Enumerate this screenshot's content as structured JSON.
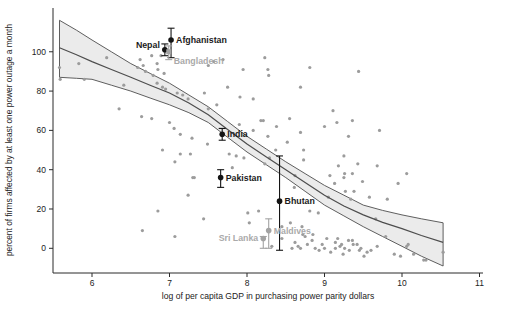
{
  "chart_data": {
    "type": "scatter",
    "title": "",
    "xlabel": "log of per capita GDP in purchasing power parity dollars",
    "ylabel": "percent of firms affected by at least one power outage a month",
    "xlim": [
      5.5,
      11.05
    ],
    "ylim": [
      -12.5,
      122
    ],
    "x_ticks": [
      6,
      7,
      8,
      9,
      10,
      11
    ],
    "y_ticks": [
      0,
      20,
      40,
      60,
      80,
      100
    ],
    "grid": "off",
    "legend": "none",
    "colors": {
      "scatter": "#9c9c9c",
      "band_fill": "#ebebeb",
      "band_edge": "#4d4d4d",
      "regression_line": "#4d4d4d",
      "labeled_dark": "#141414",
      "labeled_gray": "#a3a3a3",
      "axis": "#2b2b2b",
      "tick_text": "#222222"
    },
    "regression": {
      "x": [
        5.58,
        5.8,
        6.0,
        6.25,
        6.5,
        6.75,
        7.0,
        7.25,
        7.5,
        7.75,
        8.0,
        8.25,
        8.5,
        8.75,
        9.0,
        9.25,
        9.5,
        9.75,
        10.0,
        10.25,
        10.53
      ],
      "center": [
        102,
        98.5,
        95,
        91,
        87,
        83,
        79,
        74,
        68,
        60.5,
        53,
        46.5,
        40,
        33.5,
        27,
        21.5,
        17,
        13.2,
        10,
        6.5,
        3
      ],
      "upper": [
        116,
        111,
        106,
        100,
        94,
        89,
        84,
        78,
        72,
        64.5,
        57,
        50.5,
        44,
        38,
        32,
        27,
        22,
        19.3,
        17,
        15,
        13
      ],
      "lower": [
        87,
        86.5,
        86,
        83,
        80,
        76.5,
        73,
        69,
        64,
        56.5,
        49,
        42.5,
        36,
        29,
        22,
        16.5,
        11,
        6,
        1,
        -4,
        -9
      ]
    },
    "labeled_points": [
      {
        "name": "Nepal",
        "x": 6.94,
        "y": 101,
        "ci_low": 98,
        "ci_high": 104,
        "shade": "dark",
        "marker": "circle",
        "side": "left",
        "dy": -2
      },
      {
        "name": "Afghanistan",
        "x": 7.02,
        "y": 106,
        "ci_low": 97,
        "ci_high": 112,
        "shade": "dark",
        "marker": "circle",
        "side": "right",
        "dy": 3
      },
      {
        "name": "Bangladesh",
        "x": 6.99,
        "y": 100,
        "ci_low": 96,
        "ci_high": 103,
        "shade": "gray",
        "marker": "square",
        "side": "right",
        "dy": 12
      },
      {
        "name": "India",
        "x": 7.68,
        "y": 58,
        "ci_low": 55,
        "ci_high": 61,
        "shade": "dark",
        "marker": "circle",
        "side": "right",
        "dy": 3
      },
      {
        "name": "Pakistan",
        "x": 7.66,
        "y": 36,
        "ci_low": 31,
        "ci_high": 40,
        "shade": "dark",
        "marker": "circle",
        "side": "right",
        "dy": 3
      },
      {
        "name": "Bhutan",
        "x": 8.42,
        "y": 24,
        "ci_low": -1,
        "ci_high": 47,
        "shade": "dark",
        "marker": "circle",
        "side": "right",
        "dy": 3
      },
      {
        "name": "Maldives",
        "x": 8.28,
        "y": 9,
        "ci_low": 0,
        "ci_high": 15,
        "shade": "gray",
        "marker": "circle",
        "side": "right",
        "dy": 3
      },
      {
        "name": "Sri Lanka",
        "x": 8.21,
        "y": 5,
        "ci_low": 0,
        "ci_high": 6,
        "shade": "gray",
        "marker": "circle",
        "side": "left",
        "dy": 3
      }
    ],
    "scatter": [
      [
        5.58,
        92
      ],
      [
        5.59,
        86
      ],
      [
        5.83,
        94
      ],
      [
        5.9,
        86
      ],
      [
        6.19,
        97
      ],
      [
        6.41,
        83
      ],
      [
        6.59,
        92
      ],
      [
        6.62,
        96
      ],
      [
        6.66,
        93
      ],
      [
        6.77,
        98
      ],
      [
        6.69,
        90
      ],
      [
        6.84,
        94
      ],
      [
        6.89,
        98
      ],
      [
        6.85,
        91
      ],
      [
        6.93,
        89
      ],
      [
        6.79,
        88
      ],
      [
        6.84,
        84
      ],
      [
        6.91,
        82
      ],
      [
        6.95,
        81
      ],
      [
        7.1,
        79
      ],
      [
        7.17,
        78
      ],
      [
        7.24,
        76
      ],
      [
        6.35,
        71
      ],
      [
        6.64,
        67
      ],
      [
        6.77,
        66
      ],
      [
        7.0,
        64
      ],
      [
        7.06,
        61
      ],
      [
        7.14,
        58
      ],
      [
        7.29,
        56
      ],
      [
        7.57,
        95
      ],
      [
        7.69,
        96
      ],
      [
        7.5,
        93
      ],
      [
        7.95,
        91
      ],
      [
        8.23,
        97
      ],
      [
        8.27,
        91
      ],
      [
        8.28,
        88
      ],
      [
        8.81,
        92
      ],
      [
        8.69,
        82
      ],
      [
        7.75,
        82
      ],
      [
        7.91,
        77
      ],
      [
        8.08,
        76
      ],
      [
        7.45,
        79
      ],
      [
        7.61,
        73
      ],
      [
        7.5,
        71
      ],
      [
        9.11,
        70
      ],
      [
        8.55,
        66
      ],
      [
        8.21,
        65
      ],
      [
        8.38,
        62
      ],
      [
        8.08,
        60
      ],
      [
        8.27,
        57
      ],
      [
        9.0,
        62
      ],
      [
        9.44,
        90
      ],
      [
        9.16,
        64
      ],
      [
        9.36,
        65
      ],
      [
        9.31,
        57
      ],
      [
        9.71,
        60
      ],
      [
        7.9,
        63
      ],
      [
        8.18,
        65
      ],
      [
        8.37,
        50
      ],
      [
        8.52,
        54
      ],
      [
        8.69,
        59
      ],
      [
        8.73,
        50
      ],
      [
        7.77,
        48
      ],
      [
        7.86,
        47
      ],
      [
        7.96,
        46
      ],
      [
        8.29,
        46
      ],
      [
        7.49,
        53
      ],
      [
        8.73,
        45
      ],
      [
        8.61,
        31
      ],
      [
        7.3,
        36
      ],
      [
        7.24,
        27
      ],
      [
        6.91,
        50
      ],
      [
        7.14,
        48
      ],
      [
        7.27,
        48
      ],
      [
        7.07,
        44
      ],
      [
        7.32,
        36
      ],
      [
        6.85,
        19
      ],
      [
        6.65,
        9
      ],
      [
        7.07,
        6
      ],
      [
        7.44,
        15
      ],
      [
        7.81,
        41
      ],
      [
        8.23,
        43
      ],
      [
        8.62,
        37
      ],
      [
        9.07,
        37
      ],
      [
        9.26,
        38
      ],
      [
        9.27,
        29
      ],
      [
        9.05,
        26
      ],
      [
        9.34,
        25
      ],
      [
        8.81,
        19
      ],
      [
        8.92,
        18
      ],
      [
        8.01,
        18
      ],
      [
        8.15,
        19
      ],
      [
        8.03,
        13
      ],
      [
        8.56,
        13
      ],
      [
        8.71,
        11
      ],
      [
        8.45,
        11
      ],
      [
        8.75,
        6
      ],
      [
        8.84,
        4
      ],
      [
        8.97,
        2
      ],
      [
        9.03,
        5
      ],
      [
        9.14,
        3
      ],
      [
        9.22,
        2
      ],
      [
        9.31,
        4
      ],
      [
        9.37,
        2
      ],
      [
        8.45,
        5
      ],
      [
        8.32,
        1
      ],
      [
        8.58,
        0
      ],
      [
        8.69,
        0
      ],
      [
        9.24,
        -3
      ],
      [
        8.62,
        3
      ],
      [
        8.66,
        1
      ],
      [
        8.78,
        2
      ],
      [
        8.88,
        0
      ],
      [
        8.93,
        -1
      ],
      [
        9.0,
        0
      ],
      [
        9.08,
        -2
      ],
      [
        9.42,
        2
      ],
      [
        9.47,
        0
      ],
      [
        9.55,
        -2
      ],
      [
        8.72,
        7
      ],
      [
        8.85,
        7
      ],
      [
        9.17,
        5
      ],
      [
        9.25,
        47
      ],
      [
        9.18,
        42
      ],
      [
        9.43,
        43
      ],
      [
        9.68,
        42
      ],
      [
        9.25,
        36
      ],
      [
        9.36,
        38
      ],
      [
        9.49,
        34
      ],
      [
        10.06,
        38
      ],
      [
        9.95,
        33
      ],
      [
        9.13,
        33
      ],
      [
        9.38,
        29
      ],
      [
        9.58,
        26
      ],
      [
        9.81,
        25
      ],
      [
        9.66,
        15
      ],
      [
        9.79,
        6
      ],
      [
        10.06,
        1
      ],
      [
        10.15,
        -3
      ],
      [
        10.28,
        -6
      ],
      [
        9.14,
        0
      ],
      [
        9.2,
        1
      ],
      [
        9.26,
        0
      ],
      [
        9.36,
        4
      ],
      [
        9.32,
        -1
      ],
      [
        9.45,
        -1
      ],
      [
        9.51,
        -4
      ],
      [
        9.6,
        -1
      ],
      [
        9.68,
        1
      ],
      [
        9.9,
        -3
      ],
      [
        9.98,
        -4
      ],
      [
        10.08,
        2
      ],
      [
        10.31,
        -6
      ],
      [
        10.53,
        -2
      ]
    ],
    "layout": {
      "plot_left_px": 53,
      "plot_right_px": 483,
      "plot_top_px": 8,
      "plot_bottom_px": 273,
      "x_at_6_px": 92,
      "px_per_x_unit": 77.5,
      "y_at_0_px": 248.3,
      "px_per_y_unit": 1.9652
    }
  }
}
